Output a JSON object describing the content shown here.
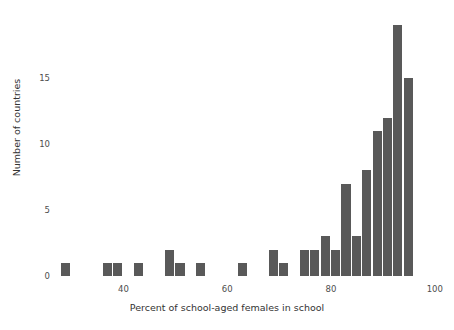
{
  "chart_data": {
    "type": "bar",
    "title": "",
    "subtitle": "",
    "xlabel": "Percent of school-aged females in school",
    "ylabel": "Number of countries",
    "xlim": [
      27,
      101
    ],
    "ylim": [
      0,
      20
    ],
    "xticks": [
      40,
      60,
      80,
      100
    ],
    "yticks": [
      0,
      5,
      10,
      15
    ],
    "grid": false,
    "legend": null,
    "bar_color": "#595959",
    "bin_width": 2,
    "bins": [
      {
        "start": 28,
        "end": 30,
        "center": 29,
        "value": 1
      },
      {
        "start": 30,
        "end": 32,
        "center": 31,
        "value": 0
      },
      {
        "start": 32,
        "end": 34,
        "center": 33,
        "value": 0
      },
      {
        "start": 34,
        "end": 36,
        "center": 35,
        "value": 0
      },
      {
        "start": 36,
        "end": 38,
        "center": 37,
        "value": 1
      },
      {
        "start": 38,
        "end": 40,
        "center": 39,
        "value": 1
      },
      {
        "start": 40,
        "end": 42,
        "center": 41,
        "value": 0
      },
      {
        "start": 42,
        "end": 44,
        "center": 43,
        "value": 1
      },
      {
        "start": 44,
        "end": 46,
        "center": 45,
        "value": 0
      },
      {
        "start": 46,
        "end": 48,
        "center": 47,
        "value": 0
      },
      {
        "start": 48,
        "end": 50,
        "center": 49,
        "value": 2
      },
      {
        "start": 50,
        "end": 52,
        "center": 51,
        "value": 1
      },
      {
        "start": 52,
        "end": 54,
        "center": 53,
        "value": 0
      },
      {
        "start": 54,
        "end": 56,
        "center": 55,
        "value": 1
      },
      {
        "start": 56,
        "end": 58,
        "center": 57,
        "value": 0
      },
      {
        "start": 58,
        "end": 60,
        "center": 59,
        "value": 0
      },
      {
        "start": 60,
        "end": 62,
        "center": 61,
        "value": 0
      },
      {
        "start": 62,
        "end": 64,
        "center": 63,
        "value": 1
      },
      {
        "start": 64,
        "end": 66,
        "center": 65,
        "value": 0
      },
      {
        "start": 66,
        "end": 68,
        "center": 67,
        "value": 0
      },
      {
        "start": 68,
        "end": 70,
        "center": 69,
        "value": 2
      },
      {
        "start": 70,
        "end": 72,
        "center": 71,
        "value": 1
      },
      {
        "start": 72,
        "end": 74,
        "center": 73,
        "value": 0
      },
      {
        "start": 74,
        "end": 76,
        "center": 75,
        "value": 2
      },
      {
        "start": 76,
        "end": 78,
        "center": 77,
        "value": 2
      },
      {
        "start": 78,
        "end": 80,
        "center": 79,
        "value": 3
      },
      {
        "start": 80,
        "end": 82,
        "center": 81,
        "value": 2
      },
      {
        "start": 82,
        "end": 84,
        "center": 83,
        "value": 7
      },
      {
        "start": 84,
        "end": 86,
        "center": 85,
        "value": 3
      },
      {
        "start": 86,
        "end": 88,
        "center": 87,
        "value": 8
      },
      {
        "start": 88,
        "end": 90,
        "center": 89,
        "value": 11
      },
      {
        "start": 90,
        "end": 92,
        "center": 91,
        "value": 12
      },
      {
        "start": 92,
        "end": 94,
        "center": 93,
        "value": 19
      },
      {
        "start": 94,
        "end": 96,
        "center": 95,
        "value": 15
      }
    ]
  },
  "axes": {
    "x_tick_labels": [
      "40",
      "60",
      "80",
      "100"
    ],
    "y_tick_labels": [
      "0",
      "5",
      "10",
      "15"
    ],
    "x_title": "Percent of school-aged females in school",
    "y_title": "Number of countries"
  }
}
